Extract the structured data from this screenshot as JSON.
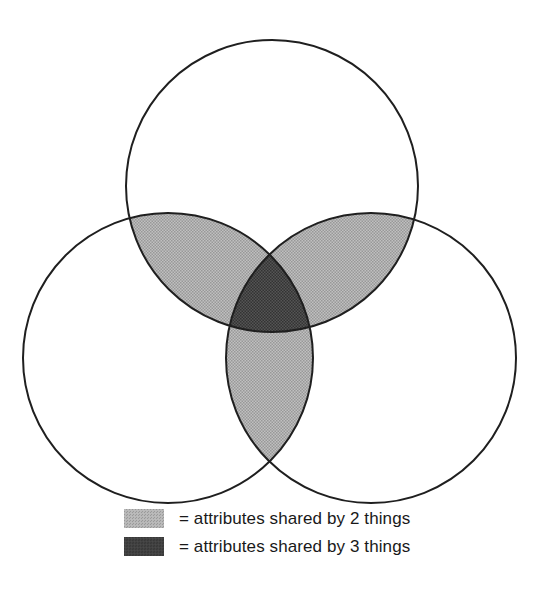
{
  "diagram": {
    "type": "venn",
    "circle_count": 3,
    "colors": {
      "background": "#ffffff",
      "outline": "#1f1f1f",
      "shared_by_2": "#b7b7b7",
      "shared_by_3": "#3d3d3d"
    },
    "regions": {
      "pairwise_intersections": "attributes shared by 2 things",
      "triple_intersection": "attributes shared by 3 things"
    }
  },
  "legend": {
    "items": [
      {
        "label": "= attributes shared by 2 things",
        "color": "#b7b7b7"
      },
      {
        "label": "= attributes shared by 3 things",
        "color": "#3d3d3d"
      }
    ]
  }
}
